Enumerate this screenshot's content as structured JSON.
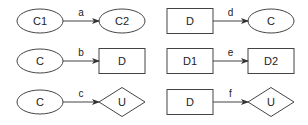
{
  "diagram": {
    "type": "relationship-patterns",
    "patterns": [
      {
        "id": "a",
        "edge_label": "a",
        "source": {
          "label": "C1",
          "shape": "ellipse"
        },
        "target": {
          "label": "C2",
          "shape": "ellipse"
        }
      },
      {
        "id": "b",
        "edge_label": "b",
        "source": {
          "label": "C",
          "shape": "ellipse"
        },
        "target": {
          "label": "D",
          "shape": "rectangle"
        }
      },
      {
        "id": "c",
        "edge_label": "c",
        "source": {
          "label": "C",
          "shape": "ellipse"
        },
        "target": {
          "label": "U",
          "shape": "diamond"
        }
      },
      {
        "id": "d",
        "edge_label": "d",
        "source": {
          "label": "D",
          "shape": "rectangle"
        },
        "target": {
          "label": "C",
          "shape": "ellipse"
        }
      },
      {
        "id": "e",
        "edge_label": "e",
        "source": {
          "label": "D1",
          "shape": "rectangle"
        },
        "target": {
          "label": "D2",
          "shape": "rectangle"
        }
      },
      {
        "id": "f",
        "edge_label": "f",
        "source": {
          "label": "D",
          "shape": "rectangle"
        },
        "target": {
          "label": "U",
          "shape": "diamond"
        }
      }
    ],
    "colors": {
      "stroke": "#444444",
      "fill": "#ffffff",
      "text": "#222222"
    }
  }
}
